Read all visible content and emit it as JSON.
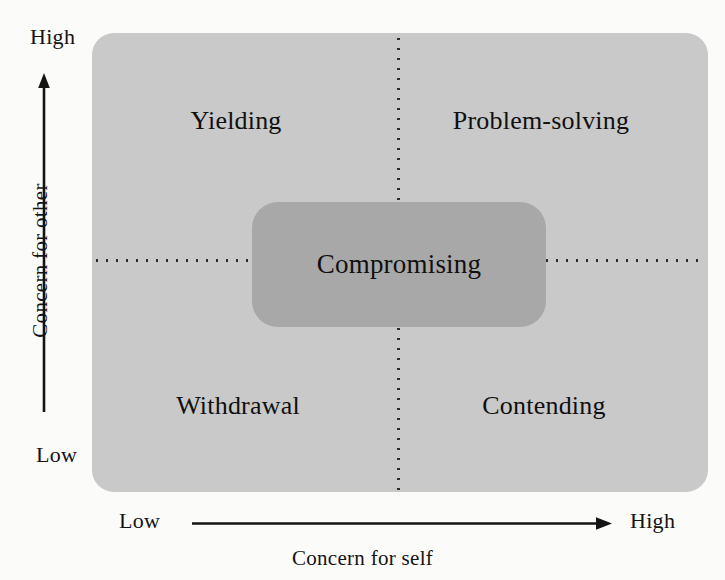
{
  "diagram": {
    "colors": {
      "background": "#fbfbfa",
      "plot_fill": "#c9c9c9",
      "center_fill": "#a8a8a8",
      "ink": "#141414"
    }
  },
  "axes": {
    "y": {
      "title": "Concern for other",
      "low_label": "Low",
      "high_label": "High",
      "direction": "upward-arrow"
    },
    "x": {
      "title": "Concern for self",
      "low_label": "Low",
      "high_label": "High",
      "direction": "rightward-arrow"
    }
  },
  "quadrants": [
    {
      "id": "yielding",
      "label": "Yielding",
      "concern_for_self": "low",
      "concern_for_other": "high"
    },
    {
      "id": "problem-solving",
      "label": "Problem-solving",
      "concern_for_self": "high",
      "concern_for_other": "high"
    },
    {
      "id": "withdrawal",
      "label": "Withdrawal",
      "concern_for_self": "low",
      "concern_for_other": "low"
    },
    {
      "id": "contending",
      "label": "Contending",
      "concern_for_self": "high",
      "concern_for_other": "low"
    }
  ],
  "center": {
    "id": "compromising",
    "label": "Compromising",
    "concern_for_self": "medium",
    "concern_for_other": "medium"
  },
  "dividers": {
    "vertical": "dotted",
    "horizontal": "dotted"
  }
}
